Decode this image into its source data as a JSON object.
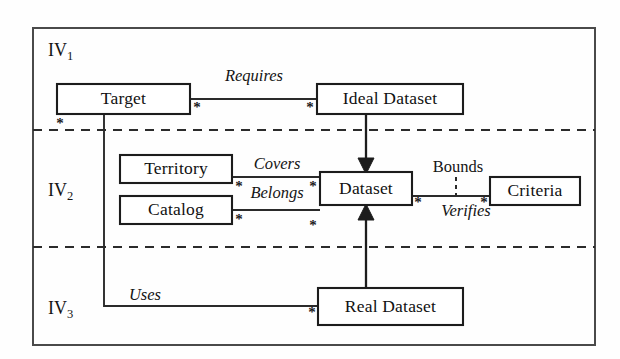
{
  "diagram": {
    "frame": {
      "x": 33,
      "y": 28,
      "width": 562,
      "height": 317
    },
    "colors": {
      "background": "#fefefe",
      "box_fill": "#ffffff",
      "box_stroke": "#1c1c1c",
      "frame_stroke": "#4a4a4a",
      "line_stroke": "#2a2a2a",
      "text": "#111111"
    },
    "bands": [
      {
        "id": "iv1",
        "label": "IV",
        "subscript": "1",
        "label_x": 48,
        "label_y": 52,
        "top": 28,
        "bottom": 130
      },
      {
        "id": "iv2",
        "label": "IV",
        "subscript": "2",
        "label_x": 48,
        "label_y": 192,
        "top": 130,
        "bottom": 247
      },
      {
        "id": "iv3",
        "label": "IV",
        "subscript": "3",
        "label_x": 48,
        "label_y": 310,
        "top": 247,
        "bottom": 345
      }
    ],
    "dividers": [
      {
        "id": "divider-iv1-iv2",
        "x1": 33,
        "y1": 130,
        "x2": 595,
        "y2": 130
      },
      {
        "id": "divider-iv2-iv3",
        "x1": 33,
        "y1": 247,
        "x2": 595,
        "y2": 247
      }
    ],
    "boxes": [
      {
        "id": "target",
        "label": "Target",
        "x": 57,
        "y": 84,
        "width": 133,
        "height": 30
      },
      {
        "id": "ideal-dataset",
        "label": "Ideal Dataset",
        "x": 317,
        "y": 84,
        "width": 146,
        "height": 30
      },
      {
        "id": "territory",
        "label": "Territory",
        "x": 120,
        "y": 155,
        "width": 112,
        "height": 28
      },
      {
        "id": "catalog",
        "label": "Catalog",
        "x": 120,
        "y": 196,
        "width": 112,
        "height": 28
      },
      {
        "id": "dataset",
        "label": "Dataset",
        "x": 320,
        "y": 172,
        "width": 92,
        "height": 33
      },
      {
        "id": "criteria",
        "label": "Criteria",
        "x": 490,
        "y": 177,
        "width": 90,
        "height": 28
      },
      {
        "id": "real-dataset",
        "label": "Real Dataset",
        "x": 318,
        "y": 288,
        "width": 145,
        "height": 37
      }
    ],
    "associations": [
      {
        "id": "requires",
        "label": "Requires",
        "label_x": 254,
        "label_y": 77,
        "italic": true,
        "path": "M 190 99 L 317 99"
      },
      {
        "id": "covers",
        "label": "Covers",
        "label_x": 277,
        "label_y": 165,
        "italic": true,
        "path": "M 232 177 L 320 177"
      },
      {
        "id": "belongs",
        "label": "Belongs",
        "label_x": 277,
        "label_y": 194,
        "italic": true,
        "path": "M 232 210 L 320 210"
      },
      {
        "id": "verifies",
        "label": "Verifies",
        "label_x": 466,
        "label_y": 212,
        "italic": true,
        "path": "M 412 196 L 490 196"
      },
      {
        "id": "bounds",
        "label": "Bounds",
        "label_x": 458,
        "label_y": 168,
        "italic": false,
        "path": ""
      },
      {
        "id": "uses",
        "label": "Uses",
        "label_x": 145,
        "label_y": 296,
        "italic": true,
        "path": "M 104 114 L 104 306 L 318 306"
      }
    ],
    "bounds_tick": {
      "x": 456,
      "y1": 177,
      "y2": 201
    },
    "generalizations": [
      {
        "id": "ideal-to-dataset",
        "from": "ideal-dataset",
        "to": "dataset",
        "path": "M 366 114 L 366 165",
        "head": "366,174 358,158 374,158"
      },
      {
        "id": "real-to-dataset",
        "from": "real-dataset",
        "to": "dataset",
        "path": "M 366 288 L 366 213",
        "head": "366,204 358,220 374,220"
      }
    ],
    "multiplicities": [
      {
        "id": "mult-target-requires",
        "symbol": "*",
        "x": 197,
        "y": 109
      },
      {
        "id": "mult-ideal-requires",
        "symbol": "*",
        "x": 310,
        "y": 109
      },
      {
        "id": "mult-target-uses",
        "symbol": "*",
        "x": 60,
        "y": 125
      },
      {
        "id": "mult-territory-covers",
        "symbol": "*",
        "x": 239,
        "y": 188
      },
      {
        "id": "mult-dataset-covers",
        "symbol": "*",
        "x": 313,
        "y": 188
      },
      {
        "id": "mult-catalog-belongs",
        "symbol": "*",
        "x": 239,
        "y": 221
      },
      {
        "id": "mult-dataset-belongs",
        "symbol": "*",
        "x": 313,
        "y": 227
      },
      {
        "id": "mult-dataset-verifies",
        "symbol": "*",
        "x": 418,
        "y": 204
      },
      {
        "id": "mult-criteria-verifies",
        "symbol": "*",
        "x": 484,
        "y": 204
      },
      {
        "id": "mult-realdataset-uses",
        "symbol": "*",
        "x": 312,
        "y": 314
      }
    ]
  }
}
